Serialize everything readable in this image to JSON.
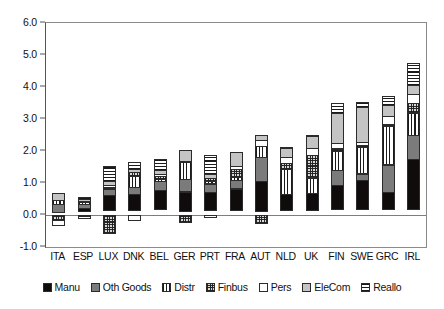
{
  "chart_data": {
    "type": "bar",
    "stacked": true,
    "title": "",
    "subtitle": "",
    "xlabel": "",
    "ylabel": "",
    "ylim": [
      -1.0,
      6.0
    ],
    "ytick_labels": [
      "6.0",
      "5.0",
      "4.0",
      "3.0",
      "2.0",
      "1.0",
      "0.0",
      "-1.0"
    ],
    "ytick_values": [
      6.0,
      5.0,
      4.0,
      3.0,
      2.0,
      1.0,
      0.0,
      -1.0
    ],
    "grid": false,
    "legend_position": "bottom",
    "categories": [
      "ITA",
      "ESP",
      "LUX",
      "DNK",
      "BEL",
      "GER",
      "PRT",
      "FRA",
      "AUT",
      "NLD",
      "UK",
      "FIN",
      "SWE",
      "GRC",
      "IRL"
    ],
    "series": [
      {
        "name": "Manu",
        "color": "#100c0c",
        "pattern": "solid-black",
        "values": [
          0.0,
          0.12,
          0.5,
          0.52,
          0.62,
          0.63,
          0.58,
          0.7,
          0.95,
          0.55,
          0.57,
          0.78,
          0.95,
          0.57,
          1.6
        ]
      },
      {
        "name": "Oth Goods",
        "color": "#7b7b7b",
        "pattern": "solid-gray",
        "values": [
          0.28,
          0.15,
          0.2,
          0.25,
          0.31,
          0.42,
          0.3,
          0.28,
          0.78,
          0.0,
          0.0,
          0.5,
          0.22,
          0.88,
          0.78
        ]
      },
      {
        "name": "Distr",
        "color": "#ffffff",
        "pattern": "vertical-lines",
        "values": [
          0.17,
          0.1,
          0.08,
          0.38,
          0.08,
          0.55,
          0.1,
          0.14,
          0.38,
          0.8,
          0.5,
          0.62,
          0.85,
          1.22,
          0.72
        ]
      },
      {
        "name": "Finbus",
        "color": "#d8d8d8",
        "pattern": "checkered",
        "values": [
          -0.18,
          -0.05,
          -0.58,
          0.13,
          0.14,
          -0.25,
          0.13,
          0.27,
          -0.28,
          0.2,
          0.73,
          0.1,
          0.1,
          0.08,
          0.32
        ]
      },
      {
        "name": "Pers",
        "color": "#ffffff",
        "pattern": "empty-white",
        "values": [
          -0.2,
          -0.08,
          0.1,
          -0.2,
          0.08,
          0.07,
          -0.08,
          0.12,
          0.2,
          0.22,
          0.25,
          0.2,
          0.12,
          0.28,
          0.3
        ]
      },
      {
        "name": "EleCom",
        "color": "#c4c4c4",
        "pattern": "solid-light-gray",
        "values": [
          0.25,
          0.1,
          0.15,
          0.12,
          0.14,
          0.35,
          0.15,
          0.45,
          0.2,
          0.3,
          0.38,
          0.95,
          1.1,
          0.38,
          0.32
        ]
      },
      {
        "name": "Reallo",
        "color": "#ffffff",
        "pattern": "horizontal-lines",
        "values": [
          0.0,
          0.08,
          0.5,
          0.25,
          0.38,
          0.0,
          0.63,
          0.0,
          0.0,
          0.05,
          0.08,
          0.35,
          0.18,
          0.32,
          0.72
        ]
      }
    ]
  },
  "legend": {
    "items": [
      {
        "label": "Manu"
      },
      {
        "label": "Oth Goods"
      },
      {
        "label": "Distr"
      },
      {
        "label": "Finbus"
      },
      {
        "label": "Pers"
      },
      {
        "label": "EleCom"
      },
      {
        "label": "Reallo"
      }
    ]
  }
}
